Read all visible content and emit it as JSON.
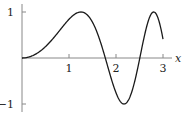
{
  "chart_data": {
    "type": "line",
    "title": "",
    "function": "sin(x^2)",
    "xlabel": "x",
    "ylabel": "",
    "xlim": [
      0,
      3.2
    ],
    "ylim": [
      -1.1,
      1.1
    ],
    "x_ticks": [
      1,
      2,
      3
    ],
    "x_tick_labels": [
      "1",
      "2",
      "3"
    ],
    "y_ticks": [
      1,
      -1
    ],
    "y_tick_labels": [
      "1",
      "−1"
    ],
    "grid": false,
    "legend": null,
    "series": [
      {
        "name": "sin(x^2)",
        "x": [
          0,
          0.5,
          1.0,
          1.25,
          1.5,
          1.77,
          2.0,
          2.17,
          2.35,
          2.51,
          2.65,
          2.8,
          2.9,
          3.0
        ],
        "y": [
          0,
          0.25,
          0.84,
          1.0,
          0.78,
          0.0,
          -0.76,
          -1.0,
          -0.68,
          0.0,
          0.66,
          1.0,
          0.86,
          0.41
        ]
      }
    ],
    "colors": {
      "curve": "#1a1a1a",
      "axis": "#888888"
    }
  }
}
